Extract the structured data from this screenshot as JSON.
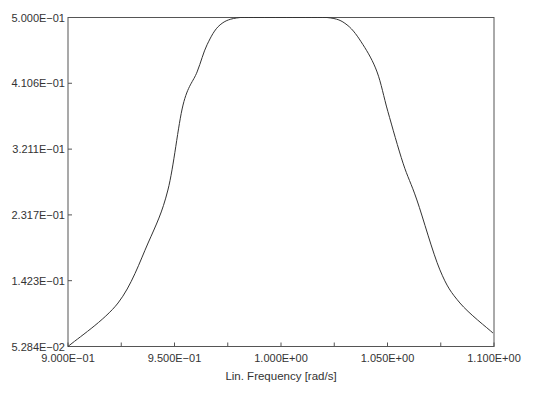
{
  "chart_data": {
    "type": "line",
    "title": "",
    "xlabel": "Lin. Frequency [rad/s]",
    "ylabel": "",
    "xlim": [
      0.9,
      1.1
    ],
    "ylim": [
      0.05284,
      0.5
    ],
    "grid": false,
    "legend": null,
    "x_ticks": [
      0.9,
      0.95,
      1.0,
      1.05,
      1.1
    ],
    "x_tick_labels": [
      "9.000E−01",
      "9.500E−01",
      "1.000E+00",
      "1.050E+00",
      "1.100E+00"
    ],
    "x_minor_ticks": [
      0.925,
      0.975,
      1.025,
      1.075
    ],
    "y_ticks": [
      0.05284,
      0.1423,
      0.2317,
      0.3211,
      0.4106,
      0.5
    ],
    "y_tick_labels": [
      "5.284E−02",
      "1.423E−01",
      "2.317E−01",
      "3.211E−01",
      "4.106E−01",
      "5.000E−01"
    ],
    "series": [
      {
        "name": "response",
        "color": "#333333",
        "x": [
          0.9,
          0.9235,
          0.9376,
          0.9469,
          0.954,
          0.9606,
          0.9653,
          0.9714,
          0.9808,
          1.0,
          1.0216,
          1.031,
          1.0385,
          1.0451,
          1.0502,
          1.0573,
          1.0638,
          1.0746,
          1.084,
          1.0995
        ],
        "values": [
          0.0528,
          0.112,
          0.1935,
          0.2655,
          0.381,
          0.426,
          0.463,
          0.49,
          0.5,
          0.5,
          0.5,
          0.49,
          0.463,
          0.426,
          0.372,
          0.302,
          0.252,
          0.157,
          0.112,
          0.0712
        ]
      }
    ]
  },
  "plot": {
    "left": 68,
    "right": 494,
    "top": 17.5,
    "bottom": 346.5
  }
}
